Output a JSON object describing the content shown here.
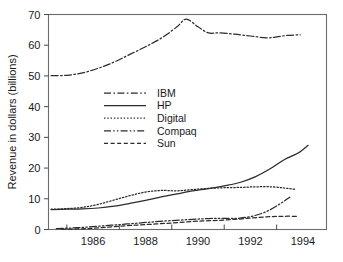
{
  "chart_data": {
    "type": "line",
    "title": "",
    "xlabel": "",
    "ylabel": "Revenue in dollars (billions)",
    "xlim": [
      1984.3,
      1994.9
    ],
    "ylim": [
      0,
      70
    ],
    "grid": false,
    "legend_position": "inside-upper-left",
    "y_ticks": [
      0,
      10,
      20,
      30,
      40,
      50,
      60,
      70
    ],
    "y_tick_labels": [
      "0",
      "10",
      "20",
      "30",
      "40",
      "50",
      "60",
      "70"
    ],
    "x_ticks": [
      1985,
      1987,
      1989,
      1991,
      1993
    ],
    "x_tick_labels": [
      "1986",
      "1988",
      "1990",
      "1992",
      "1994"
    ],
    "x_label_positions": [
      1986,
      1988,
      1990,
      1992,
      1994
    ],
    "series": [
      {
        "name": "IBM",
        "style": "dash-dot",
        "x": [
          1984.4,
          1985.0,
          1985.6,
          1986.2,
          1986.8,
          1987.4,
          1988.0,
          1988.6,
          1989.2,
          1989.55,
          1990.0,
          1990.4,
          1990.8,
          1991.4,
          1992.0,
          1992.6,
          1993.0,
          1993.4,
          1993.9
        ],
        "values": [
          50.1,
          50.2,
          51.0,
          52.5,
          54.5,
          57.0,
          59.5,
          62.3,
          66.0,
          68.5,
          66.0,
          64.0,
          64.0,
          63.6,
          63.0,
          62.4,
          62.7,
          63.2,
          63.4
        ]
      },
      {
        "name": "HP",
        "style": "solid",
        "x": [
          1984.4,
          1985.0,
          1985.6,
          1986.2,
          1986.8,
          1987.4,
          1988.0,
          1988.6,
          1989.2,
          1989.8,
          1990.4,
          1991.0,
          1991.6,
          1992.2,
          1992.8,
          1993.3,
          1993.8,
          1994.2
        ],
        "values": [
          6.5,
          6.6,
          6.7,
          7.0,
          7.6,
          8.5,
          9.5,
          10.6,
          11.6,
          12.6,
          13.3,
          14.2,
          15.3,
          17.2,
          20.0,
          22.8,
          24.8,
          27.4
        ]
      },
      {
        "name": "Digital",
        "style": "dotted",
        "x": [
          1984.4,
          1985.0,
          1985.6,
          1986.2,
          1986.8,
          1987.4,
          1988.0,
          1988.6,
          1989.2,
          1989.8,
          1990.4,
          1991.0,
          1991.6,
          1992.2,
          1992.8,
          1993.3,
          1993.7
        ],
        "values": [
          6.6,
          6.8,
          7.2,
          8.2,
          9.6,
          11.0,
          12.2,
          12.7,
          12.6,
          13.0,
          13.4,
          13.6,
          13.7,
          13.9,
          13.9,
          13.5,
          13.1
        ]
      },
      {
        "name": "Compaq",
        "style": "dash-dot-dot",
        "x": [
          1984.6,
          1985.2,
          1985.8,
          1986.4,
          1987.0,
          1987.6,
          1988.2,
          1988.8,
          1989.4,
          1990.0,
          1990.6,
          1991.2,
          1991.6,
          1992.1,
          1992.6,
          1993.1,
          1993.5
        ],
        "values": [
          0.3,
          0.5,
          0.8,
          1.2,
          1.6,
          2.0,
          2.4,
          2.8,
          3.1,
          3.4,
          3.6,
          3.6,
          3.7,
          4.4,
          5.8,
          8.2,
          10.5
        ]
      },
      {
        "name": "Sun",
        "style": "dashed",
        "x": [
          1984.8,
          1985.4,
          1986.0,
          1986.6,
          1987.2,
          1987.8,
          1988.4,
          1989.0,
          1989.6,
          1990.2,
          1990.8,
          1991.4,
          1992.0,
          1992.6,
          1993.2,
          1993.8
        ],
        "values": [
          0.1,
          0.2,
          0.4,
          0.8,
          1.2,
          1.5,
          1.8,
          2.1,
          2.5,
          2.8,
          3.0,
          3.3,
          3.7,
          4.1,
          4.3,
          4.3
        ]
      }
    ]
  },
  "legend": {
    "items": [
      {
        "label": "IBM",
        "style": "dash-dot"
      },
      {
        "label": "HP",
        "style": "solid"
      },
      {
        "label": "Digital",
        "style": "dotted"
      },
      {
        "label": "Compaq",
        "style": "dash-dot-dot"
      },
      {
        "label": "Sun",
        "style": "dashed"
      }
    ]
  },
  "colors": {
    "background": "#ffffff",
    "ink": "#2b2b2b",
    "frame": "#6b6b6b"
  }
}
